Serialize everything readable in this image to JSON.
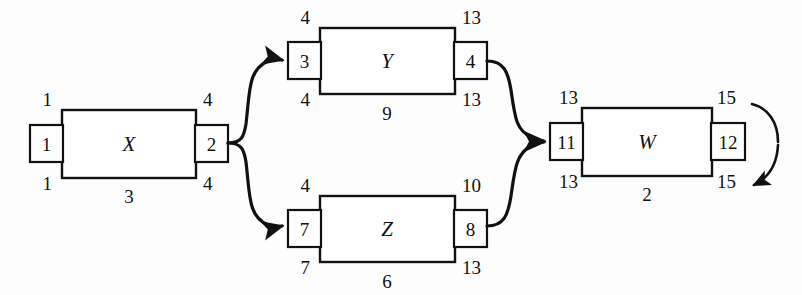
{
  "diagram": {
    "type": "activity-on-node-network",
    "nodes": [
      {
        "id": "X",
        "name": "X",
        "top_left": "1",
        "top_right": "4",
        "left_tab": "1",
        "right_tab": "2",
        "bottom_left": "1",
        "bottom_right": "4",
        "duration": "3"
      },
      {
        "id": "Y",
        "name": "Y",
        "top_left": "4",
        "top_right": "13",
        "left_tab": "3",
        "right_tab": "4",
        "bottom_left": "4",
        "bottom_right": "13",
        "duration": "9"
      },
      {
        "id": "Z",
        "name": "Z",
        "top_left": "4",
        "top_right": "10",
        "left_tab": "7",
        "right_tab": "8",
        "bottom_left": "7",
        "bottom_right": "13",
        "duration": "6"
      },
      {
        "id": "W",
        "name": "W",
        "top_left": "13",
        "top_right": "15",
        "left_tab": "11",
        "right_tab": "12",
        "bottom_left": "13",
        "bottom_right": "15",
        "duration": "2"
      }
    ],
    "edges": [
      {
        "from": "X",
        "to": "Y",
        "arrow": "arrowhead-icon"
      },
      {
        "from": "X",
        "to": "Z",
        "arrow": "arrowhead-icon"
      },
      {
        "from": "Y",
        "to": "W",
        "arrow": "arrowhead-icon"
      },
      {
        "from": "Z",
        "to": "W",
        "arrow": "arrowhead-icon"
      }
    ],
    "terminator": {
      "name": "finish-loop-arrow",
      "arrow": "curved-arrow-icon"
    },
    "colors": {
      "stroke": "#111111",
      "fill": "#ffffff",
      "background": "#fdfdfd"
    }
  }
}
